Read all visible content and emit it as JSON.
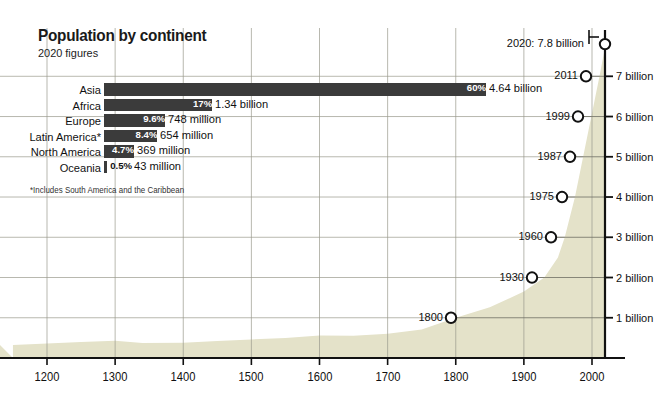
{
  "header": {
    "title": "Population by continent",
    "subtitle": "2020 figures"
  },
  "bars": {
    "footnote": "*Includes South America and the Caribbean",
    "bar_color": "#3b3b3b",
    "rows": [
      {
        "label": "Asia",
        "pct": "60%",
        "value": "4.64 billion",
        "pct_num": 60.0
      },
      {
        "label": "Africa",
        "pct": "17%",
        "value": "1.34 billion",
        "pct_num": 17.0
      },
      {
        "label": "Europe",
        "pct": "9.6%",
        "value": "748 million",
        "pct_num": 9.6
      },
      {
        "label": "Latin America*",
        "pct": "8.4%",
        "value": "654 million",
        "pct_num": 8.4
      },
      {
        "label": "North America",
        "pct": "4.7%",
        "value": "369 million",
        "pct_num": 4.7
      },
      {
        "label": "Oceania",
        "pct": "0.5%",
        "value": "43 million",
        "pct_num": 0.5
      }
    ]
  },
  "chart_data": {
    "type": "area",
    "xlabel": "",
    "ylabel": "",
    "xlim": [
      1150,
      2030
    ],
    "ylim": [
      0,
      8.2
    ],
    "grid": true,
    "axis_position": "right",
    "fill_color": "#e4e2c9",
    "x_ticks": [
      "1200",
      "1300",
      "1400",
      "1500",
      "1600",
      "1700",
      "1800",
      "1900",
      "2000"
    ],
    "x_tick_values": [
      1200,
      1300,
      1400,
      1500,
      1600,
      1700,
      1800,
      1900,
      2000
    ],
    "y_ticks": [
      "1 billion",
      "2 billion",
      "3 billion",
      "4 billion",
      "5 billion",
      "6 billion",
      "7 billion"
    ],
    "y_tick_values": [
      1,
      2,
      3,
      4,
      5,
      6,
      7
    ],
    "callout": "2020: 7.8 billion",
    "milestones": [
      {
        "label": "1800",
        "year": 1800,
        "value": 1
      },
      {
        "label": "1930",
        "year": 1930,
        "value": 2
      },
      {
        "label": "1960",
        "year": 1960,
        "value": 3
      },
      {
        "label": "1975",
        "year": 1975,
        "value": 4
      },
      {
        "label": "1987",
        "year": 1987,
        "value": 5
      },
      {
        "label": "1999",
        "year": 1999,
        "value": 6
      },
      {
        "label": "2011",
        "year": 2011,
        "value": 7
      },
      {
        "label": "2020",
        "year": 2020,
        "value": 7.8
      }
    ],
    "x": [
      1150,
      1200,
      1250,
      1300,
      1340,
      1400,
      1450,
      1500,
      1550,
      1600,
      1650,
      1700,
      1750,
      1800,
      1850,
      1900,
      1930,
      1950,
      1960,
      1975,
      1987,
      1999,
      2011,
      2020
    ],
    "values": [
      0.32,
      0.36,
      0.4,
      0.43,
      0.37,
      0.38,
      0.42,
      0.46,
      0.5,
      0.56,
      0.55,
      0.6,
      0.71,
      1.0,
      1.26,
      1.65,
      2.0,
      2.5,
      3.0,
      4.0,
      5.0,
      6.0,
      7.0,
      7.8
    ]
  }
}
